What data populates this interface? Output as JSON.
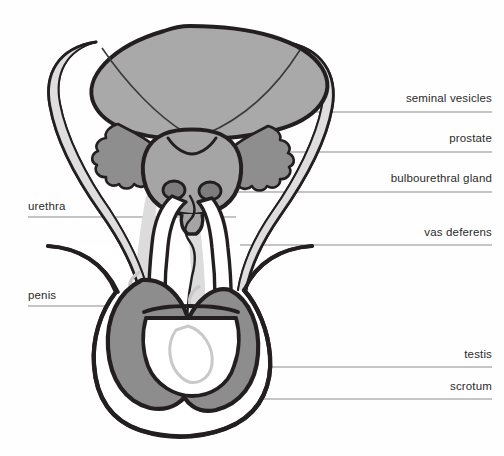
{
  "figure": {
    "background_color": "#fefefe",
    "outline_color": "#231f20",
    "leader_line_color": "#8b8b8b"
  },
  "palette": {
    "bladder_fill": "#a9a9a9",
    "seminal_vesicle_fill": "#8e8e8e",
    "prostate_fill": "#a5a5a5",
    "bulbourethral_fill": "#7d7d7d",
    "testis_fill": "#8d8d8d",
    "scrotum_fill": "#ffffff",
    "duct_fill": "#d9d9d9",
    "penis_fill": "#ffffff",
    "faint_detail": "#c9c9c9"
  },
  "labels": [
    {
      "id": "seminal-vesicles",
      "text": "seminal vesicles",
      "side": "right",
      "text_x": 388,
      "text_y": 92,
      "line_y": 112,
      "line_x1": 268,
      "line_x2": 492
    },
    {
      "id": "prostate",
      "text": "prostate",
      "side": "right",
      "text_x": 388,
      "text_y": 132,
      "line_y": 152,
      "line_x1": 228,
      "line_x2": 492
    },
    {
      "id": "bulbourethral-gland",
      "text": "bulbourethral gland",
      "side": "right",
      "text_x": 388,
      "text_y": 172,
      "line_y": 192,
      "line_x1": 196,
      "line_x2": 492
    },
    {
      "id": "vas-deferens",
      "text": "vas deferens",
      "side": "right",
      "text_x": 388,
      "text_y": 226,
      "line_y": 245,
      "line_x1": 240,
      "line_x2": 492
    },
    {
      "id": "testis",
      "text": "testis",
      "side": "right",
      "text_x": 388,
      "text_y": 348,
      "line_y": 367,
      "line_x1": 234,
      "line_x2": 492
    },
    {
      "id": "scrotum",
      "text": "scrotum",
      "side": "right",
      "text_x": 388,
      "text_y": 380,
      "line_y": 399,
      "line_x1": 256,
      "line_x2": 492
    },
    {
      "id": "urethra",
      "text": "urethra",
      "side": "left",
      "text_x": 28,
      "text_y": 200,
      "line_y": 217,
      "line_x1": 28,
      "line_x2": 236
    },
    {
      "id": "penis",
      "text": "penis",
      "side": "left",
      "text_x": 28,
      "text_y": 289,
      "line_y": 306,
      "line_x1": 28,
      "line_x2": 176
    }
  ],
  "structures": [
    {
      "id": "bladder",
      "name": "bladder"
    },
    {
      "id": "seminal-vesicles",
      "name": "seminal vesicles"
    },
    {
      "id": "prostate",
      "name": "prostate"
    },
    {
      "id": "bulbourethral-gland",
      "name": "bulbourethral gland"
    },
    {
      "id": "vas-deferens",
      "name": "vas deferens"
    },
    {
      "id": "urethra",
      "name": "urethra"
    },
    {
      "id": "penis",
      "name": "penis"
    },
    {
      "id": "testis",
      "name": "testis"
    },
    {
      "id": "scrotum",
      "name": "scrotum"
    }
  ]
}
